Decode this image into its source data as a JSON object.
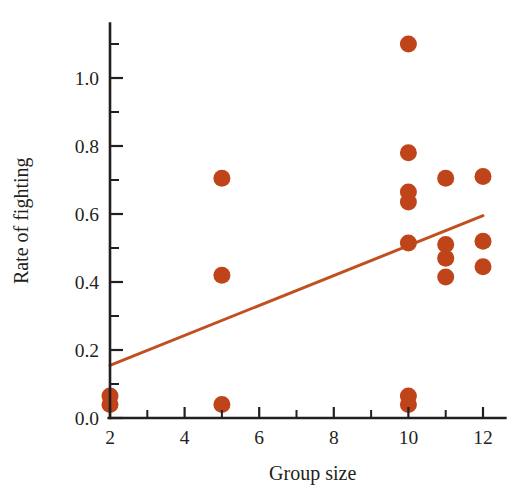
{
  "chart_data": {
    "type": "scatter",
    "title": "",
    "xlabel": "Group size",
    "ylabel": "Rate of fighting",
    "xlim": [
      2,
      12.6
    ],
    "ylim": [
      0,
      1.16
    ],
    "grid": false,
    "legend": "none",
    "point_color": "#C0441A",
    "line_color": "#C0501F",
    "axis_color": "#231f20",
    "x_ticks_major": [
      2,
      4,
      6,
      8,
      10,
      12
    ],
    "x_tick_labels": [
      "2",
      "4",
      "6",
      "8",
      "10",
      "12"
    ],
    "x_ticks_minor": [
      3,
      5,
      7,
      9,
      11
    ],
    "y_ticks_major": [
      0.0,
      0.2,
      0.4,
      0.6,
      0.8,
      1.0
    ],
    "y_tick_labels": [
      "0.0",
      "0.2",
      "0.4",
      "0.6",
      "0.8",
      "1.0"
    ],
    "y_ticks_minor": [
      0.1,
      0.3,
      0.5,
      0.7,
      0.9,
      1.1
    ],
    "points": [
      {
        "x": 2,
        "y": 0.065
      },
      {
        "x": 2,
        "y": 0.04
      },
      {
        "x": 5,
        "y": 0.705
      },
      {
        "x": 5,
        "y": 0.42
      },
      {
        "x": 5,
        "y": 0.04
      },
      {
        "x": 10,
        "y": 1.1
      },
      {
        "x": 10,
        "y": 0.78
      },
      {
        "x": 10,
        "y": 0.665
      },
      {
        "x": 10,
        "y": 0.635
      },
      {
        "x": 10,
        "y": 0.515
      },
      {
        "x": 10,
        "y": 0.065
      },
      {
        "x": 10,
        "y": 0.04
      },
      {
        "x": 11,
        "y": 0.705
      },
      {
        "x": 11,
        "y": 0.51
      },
      {
        "x": 11,
        "y": 0.47
      },
      {
        "x": 11,
        "y": 0.415
      },
      {
        "x": 12,
        "y": 0.71
      },
      {
        "x": 12,
        "y": 0.52
      },
      {
        "x": 12,
        "y": 0.445
      }
    ],
    "trend_line": {
      "x_start": 2,
      "y_start": 0.155,
      "x_end": 12.0,
      "y_end": 0.595
    },
    "point_radius_px": 8.5,
    "line_width_px": 3.0
  },
  "axes_geometry": {
    "x_pixel_at_2": 110,
    "x_pixel_at_12": 483,
    "y_pixel_at_0": 418,
    "y_pixel_at_1": 78
  }
}
